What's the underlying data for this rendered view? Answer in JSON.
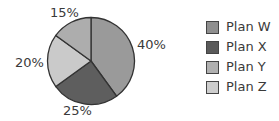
{
  "chart_data": {
    "type": "pie",
    "title": "",
    "categories": [
      "Plan W",
      "Plan X",
      "Plan Y",
      "Plan Z"
    ],
    "values": [
      40,
      25,
      20,
      15
    ],
    "labels": [
      "40%",
      "25%",
      "20%",
      "15%"
    ],
    "slice_colors": [
      "#9a9a9a",
      "#5e5e5e",
      "#cacaca",
      "#adadad"
    ],
    "legend_colors": [
      "#8f8f8f",
      "#5a5a5a",
      "#b0b0b0",
      "#cdcdcd"
    ],
    "start_angle_deg": 0,
    "direction": "clockwise",
    "legend_position": "right"
  },
  "pie": {
    "labels": {
      "w": "40%",
      "x": "25%",
      "y": "20%",
      "z": "15%"
    }
  },
  "legend": {
    "items": [
      {
        "label": "Plan W",
        "color": "#8f8f8f"
      },
      {
        "label": "Plan X",
        "color": "#5a5a5a"
      },
      {
        "label": "Plan Y",
        "color": "#b0b0b0"
      },
      {
        "label": "Plan Z",
        "color": "#cdcdcd"
      }
    ]
  }
}
